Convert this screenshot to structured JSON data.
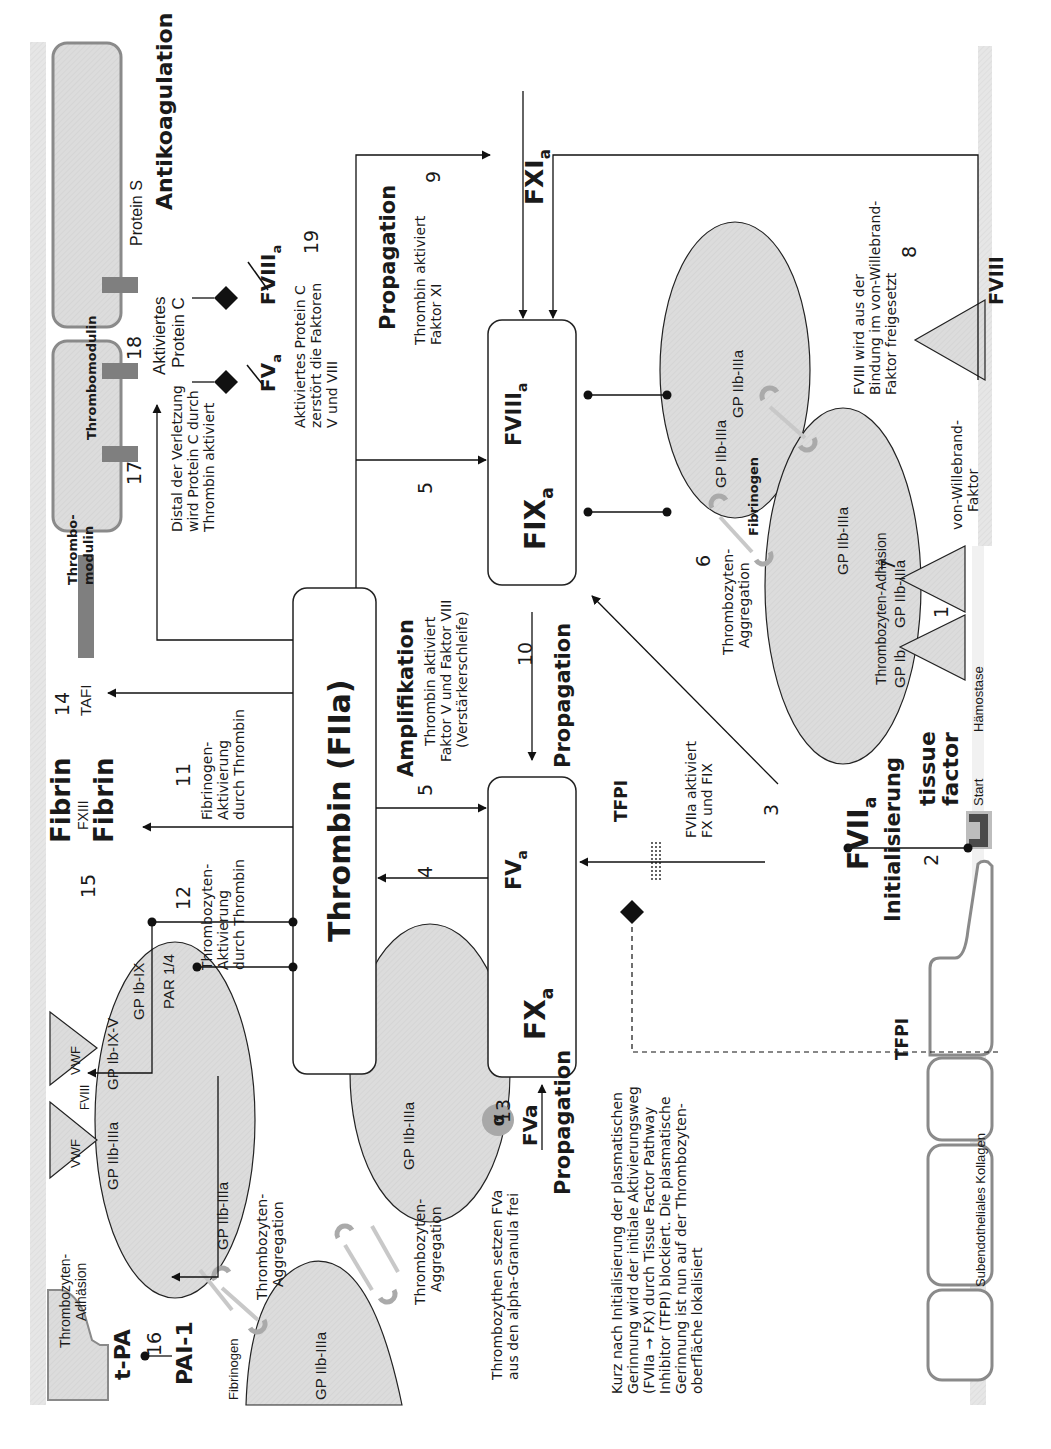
{
  "colors": {
    "band": "#e4e4e4",
    "platelet": "#d9d9d9",
    "box_stroke": "#222222",
    "cell_stroke": "#8a8a8a",
    "thrombomodulin": "#7f7f7f",
    "tissue_factor": "#4a4a4a",
    "alpha_granule": "#a8a8a8"
  },
  "sections": {
    "antikoagulation": "Antikoagulation",
    "amplifikation": "Amplifikation",
    "propagation_top": "Propagation",
    "propagation_mid": "Propagation",
    "propagation_bottom": "Propagation",
    "initialisierung": "Initialisierung"
  },
  "nodes": {
    "thrombin": "Thrombin (FIIa)",
    "fxa": "FX",
    "fxa_sub": "a",
    "fva": "FV",
    "fva_sub": "a",
    "fixa": "FIX",
    "fixa_sub": "a",
    "fviiia": "FVIII",
    "fviiia_sub": "a",
    "fxia": "FXI",
    "fxia_sub": "a",
    "fviia": "FVII",
    "fviia_sub": "a",
    "tissue_factor_1": "tissue",
    "tissue_factor_2": "factor",
    "start": "Start",
    "fibrin_1": "Fibrin",
    "fxiii": "FXIII",
    "fibrin_2": "Fibrin",
    "tafi": "TAFI",
    "tpa": "t-PA",
    "pai1": "PAI-1",
    "tfpi_top": "TFPI",
    "tfpi_bottom": "TFPI",
    "fviii_right": "FVIII",
    "fva_released": "FVa",
    "alpha": "α"
  },
  "inactivated": {
    "fva": "FV",
    "fva_sub": "a",
    "fviiia": "FVIII",
    "fviiia_sub": "a"
  },
  "step_numbers": [
    "1",
    "2",
    "3",
    "4",
    "5",
    "5",
    "6",
    "7",
    "8",
    "9",
    "10",
    "11",
    "12",
    "13",
    "14",
    "15",
    "16",
    "17",
    "18",
    "19"
  ],
  "annotations": {
    "distal": [
      "Distal der Verletzung",
      "wird Protein C durch",
      "Thrombin aktiviert"
    ],
    "apc_destroys": [
      "Aktiviertes Protein C",
      "zerstört die Faktoren",
      "V und VIII"
    ],
    "apc_label": [
      "Aktiviertes",
      "Protein C"
    ],
    "protein_s": "Protein S",
    "thrombomodulin_1": "Thrombomodulin",
    "thrombomodulin_2": [
      "Thrombo-",
      "modulin"
    ],
    "thrombin_fxi": [
      "Thrombin aktiviert",
      "Faktor XI"
    ],
    "amplifikation_desc": [
      "Thrombin aktiviert",
      "Faktor V und Faktor VIII",
      "(Verstärkerschleife)"
    ],
    "fviii_release": [
      "FVIII wird aus der",
      "Bindung im von-Willebrand-",
      "Faktor freigesetzt"
    ],
    "vwf_right": [
      "von-Willebrand-",
      "Faktor"
    ],
    "fibrinogen_activation": [
      "Fibrinogen-",
      "Aktivierung",
      "durch Thrombin"
    ],
    "platelet_activation": [
      "Thrombozyten-",
      "Aktivierung",
      "durch Thrombin"
    ],
    "fviia_activates": [
      "FVIIa aktiviert",
      "FX und FIX"
    ],
    "platelets_release": [
      "Thrombozythen setzen FVa",
      "aus den alpha-Granula frei"
    ],
    "tfpi_note": [
      "Kurz nach Initialisierung der plasmatischen",
      "Gerinnung wird der initiale Aktivierungsweg",
      "(FVIIa → FX) durch Tissue Factor Pathway",
      "Inhibitor (TFPI) blockiert. Die plasmatische",
      "Gerinnung ist nun auf der Thrombozyten-",
      "oberfläche lokalisiert"
    ],
    "subendothelial": "Subendotheliales Kollagen",
    "haemostase": "Hämostase",
    "fibrinogen_right": "Fibrinogen",
    "fibrinogen_left": "Fibrinogen",
    "aggregation_right": [
      "Thrombozyten-",
      "Aggregation"
    ],
    "aggregation_left_1": [
      "Thrombozyten-",
      "Aggregation"
    ],
    "aggregation_left_2": [
      "Thrombozyten-",
      "Aggregation"
    ],
    "adhesion_right": "Thrombozyten-Adhäsion",
    "adhesion_left": [
      "Thrombozyten-",
      "Adhäsion"
    ]
  },
  "receptors": {
    "gp2b3a": "GP IIb-IIIa",
    "gp1b": "GP Ib",
    "gp1b9": "GP Ib-IX",
    "gp1b9v": "GP Ib-IX-V",
    "par": "PAR 1/4",
    "vwf": "VWF",
    "fviii_small": "FVIII"
  }
}
